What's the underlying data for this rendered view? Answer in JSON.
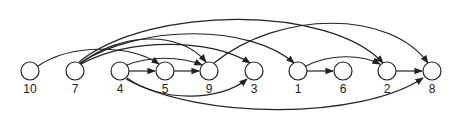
{
  "diagram": {
    "type": "topological-order-dag",
    "node_radius": 9,
    "nodes": [
      {
        "id": "10",
        "label": "10",
        "x": 30,
        "y": 71
      },
      {
        "id": "7",
        "label": "7",
        "x": 75,
        "y": 71
      },
      {
        "id": "4",
        "label": "4",
        "x": 120,
        "y": 71
      },
      {
        "id": "5",
        "label": "5",
        "x": 165,
        "y": 71
      },
      {
        "id": "9",
        "label": "9",
        "x": 209,
        "y": 71
      },
      {
        "id": "3",
        "label": "3",
        "x": 254,
        "y": 71
      },
      {
        "id": "1",
        "label": "1",
        "x": 298,
        "y": 71
      },
      {
        "id": "6",
        "label": "6",
        "x": 343,
        "y": 71
      },
      {
        "id": "2",
        "label": "2",
        "x": 387,
        "y": 71
      },
      {
        "id": "8",
        "label": "8",
        "x": 432,
        "y": 71
      }
    ],
    "edges": [
      {
        "from": "10",
        "to": "5",
        "path": "M38,66 C70,44 130,44 159,64"
      },
      {
        "from": "7",
        "to": "9",
        "path": "M80,64 C120,32 180,30 206,62"
      },
      {
        "from": "7",
        "to": "3",
        "path": "M81,64 C130,38 210,38 250,63"
      },
      {
        "from": "7",
        "to": "1",
        "path": "M80,63 C140,24 250,24 294,63"
      },
      {
        "from": "7",
        "to": "2",
        "path": "M79,62 C150,5 330,5 383,63"
      },
      {
        "from": "4",
        "to": "5",
        "path": "M129,71 L155,71"
      },
      {
        "from": "4",
        "to": "9",
        "path": "M127,65 C150,56 180,56 202,65"
      },
      {
        "from": "4",
        "to": "3",
        "path": "M127,78 C160,102 220,102 247,79"
      },
      {
        "from": "4",
        "to": "8",
        "path": "M126,79 C200,120 360,120 423,78"
      },
      {
        "from": "5",
        "to": "9",
        "path": "M174,71 L199,71"
      },
      {
        "from": "9",
        "to": "8",
        "path": "M214,63 C280,10 390,10 428,63"
      },
      {
        "from": "1",
        "to": "6",
        "path": "M307,71 L333,71"
      },
      {
        "from": "1",
        "to": "2",
        "path": "M306,66 C330,54 360,54 380,64"
      },
      {
        "from": "2",
        "to": "8",
        "path": "M396,71 L422,71"
      }
    ]
  }
}
